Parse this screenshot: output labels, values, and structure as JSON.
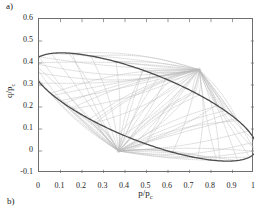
{
  "panels": {
    "top_label": "a)",
    "bottom_label": "b)"
  },
  "chart_data": {
    "type": "line",
    "title": "",
    "xlabel": "p/p_c",
    "ylabel": "q/p_c",
    "xlim": [
      0,
      1
    ],
    "ylim": [
      -0.1,
      0.6
    ],
    "xticks": [
      0,
      0.1,
      0.2,
      0.3,
      0.4,
      0.5,
      0.6,
      0.7,
      0.8,
      0.9,
      1
    ],
    "yticks": [
      -0.1,
      0,
      0.1,
      0.2,
      0.3,
      0.4,
      0.5,
      0.6
    ],
    "xticklabels": [
      "0",
      "0.1",
      "0.2",
      "0.3",
      "0.4",
      "0.5",
      "0.6",
      "0.7",
      "0.8",
      "0.9",
      "1"
    ],
    "yticklabels": [
      "-0.1",
      "0",
      "0.1",
      "0.2",
      "0.3",
      "0.4",
      "0.5",
      "0.6"
    ],
    "grid": false,
    "legend": null,
    "box": true,
    "tick_direction": "in",
    "series": [
      {
        "name": "yield-surface-ellipse",
        "type": "closed-curve",
        "color": "#4d4d4d",
        "linewidth": 1.3,
        "linestyle": "solid",
        "description": "Inclined closed ellipse passing through origin (0,0) and right vertex near (0.98,0.40)",
        "ellipse": {
          "center_x": 0.49,
          "center_y": 0.2,
          "semi_major": 0.555,
          "semi_minor": 0.155,
          "rotation_deg": -21.0
        },
        "extrema": {
          "leftmost": [
            0.0,
            0.0
          ],
          "rightmost": [
            0.98,
            0.4
          ],
          "topmost": [
            0.755,
            0.545
          ],
          "bottommost": [
            0.225,
            -0.075
          ]
        }
      },
      {
        "name": "characteristic-fan-lower",
        "type": "dotted-curve-family",
        "color": "#b9b9b9",
        "linewidth": 0.55,
        "linestyle": "dotted",
        "focus_x": 0.37,
        "focus_y": 0.0,
        "count": 26,
        "description": "Family of faint dotted characteristic curves converging at focal node (0.37, 0.00)"
      },
      {
        "name": "characteristic-fan-upper",
        "type": "dotted-curve-family",
        "color": "#b9b9b9",
        "linewidth": 0.55,
        "linestyle": "dotted",
        "focus_x": 0.745,
        "focus_y": 0.37,
        "count": 26,
        "description": "Family of faint dotted characteristic curves converging at focal node (0.745, 0.37)"
      }
    ],
    "focal_points": [
      {
        "name": "lower-node",
        "x": 0.37,
        "y": 0.0
      },
      {
        "name": "upper-node",
        "x": 0.745,
        "y": 0.37
      }
    ],
    "colors": {
      "axis": "#6e6e6e",
      "ellipse": "#4d4d4d",
      "characteristics": "#b9b9b9",
      "text": "#1a1a1a",
      "background": "#ffffff"
    }
  }
}
